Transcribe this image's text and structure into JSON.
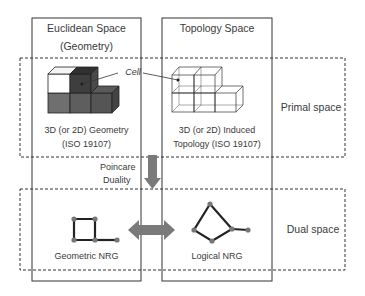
{
  "columns": {
    "euclidean": {
      "title_line1": "Euclidean Space",
      "title_line2": "(Geometry)"
    },
    "topology": {
      "title": "Topology Space"
    }
  },
  "primal": {
    "label": "Primal space",
    "geometry_caption_line1": "3D (or 2D) Geometry",
    "geometry_caption_line2": "(ISO 19107)",
    "topology_caption_line1": "3D (or 2D) Induced",
    "topology_caption_line2": "Topology (ISO 19107)",
    "cell_label": "Cell"
  },
  "transition": {
    "label_line1": "Poincare",
    "label_line2": "Duality"
  },
  "dual": {
    "label": "Dual space",
    "geometric_caption": "Geometric NRG",
    "logical_caption": "Logical NRG"
  },
  "colors": {
    "arrow": "#7a7a7a",
    "node": "#777777",
    "edge": "#222222",
    "cube_dark": "#3e3e3e",
    "cube_mid": "#6a6a6a"
  }
}
